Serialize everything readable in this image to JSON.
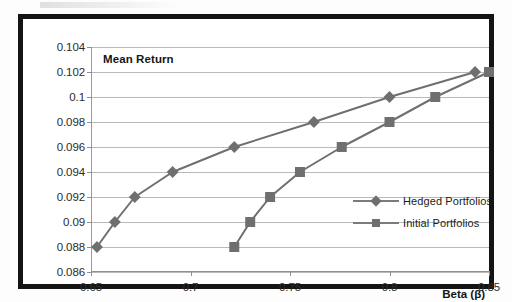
{
  "chart_data": {
    "type": "line",
    "title": "",
    "xlabel": "Beta (β)",
    "ylabel": "Mean Return",
    "xlim": [
      0.65,
      0.85
    ],
    "ylim": [
      0.086,
      0.104
    ],
    "xticks": [
      "0.65",
      "0.7",
      "0.75",
      "0.8",
      "0.85"
    ],
    "xtick_values": [
      0.65,
      0.7,
      0.75,
      0.8,
      0.85
    ],
    "yticks": [
      "0.086",
      "0.088",
      "0.09",
      "0.092",
      "0.094",
      "0.096",
      "0.098",
      "0.1",
      "0.102",
      "0.104"
    ],
    "ytick_values": [
      0.086,
      0.088,
      0.09,
      0.092,
      0.094,
      0.096,
      0.098,
      0.1,
      0.102,
      0.104
    ],
    "grid": true,
    "legend_position": "center-right",
    "series": [
      {
        "name": "Hedged Portfolios",
        "marker": "diamond",
        "color": "#6f6f6f",
        "points": [
          {
            "x": 0.653,
            "y": 0.088
          },
          {
            "x": 0.662,
            "y": 0.09
          },
          {
            "x": 0.672,
            "y": 0.092
          },
          {
            "x": 0.691,
            "y": 0.094
          },
          {
            "x": 0.722,
            "y": 0.096
          },
          {
            "x": 0.762,
            "y": 0.098
          },
          {
            "x": 0.8,
            "y": 0.1
          },
          {
            "x": 0.843,
            "y": 0.102
          }
        ]
      },
      {
        "name": "Initial Portfolios",
        "marker": "square",
        "color": "#6f6f6f",
        "points": [
          {
            "x": 0.722,
            "y": 0.088
          },
          {
            "x": 0.73,
            "y": 0.09
          },
          {
            "x": 0.74,
            "y": 0.092
          },
          {
            "x": 0.755,
            "y": 0.094
          },
          {
            "x": 0.776,
            "y": 0.096
          },
          {
            "x": 0.8,
            "y": 0.098
          },
          {
            "x": 0.823,
            "y": 0.1
          },
          {
            "x": 0.85,
            "y": 0.102
          }
        ]
      }
    ]
  },
  "legend": {
    "items": [
      {
        "label": "Hedged Portfolios"
      },
      {
        "label": "Initial Portfolios"
      }
    ]
  },
  "colors": {
    "series_gray": "#6f6f6f",
    "gridline": "#b9b9b9",
    "frame": "#141414",
    "text": "#1b1b1b"
  }
}
